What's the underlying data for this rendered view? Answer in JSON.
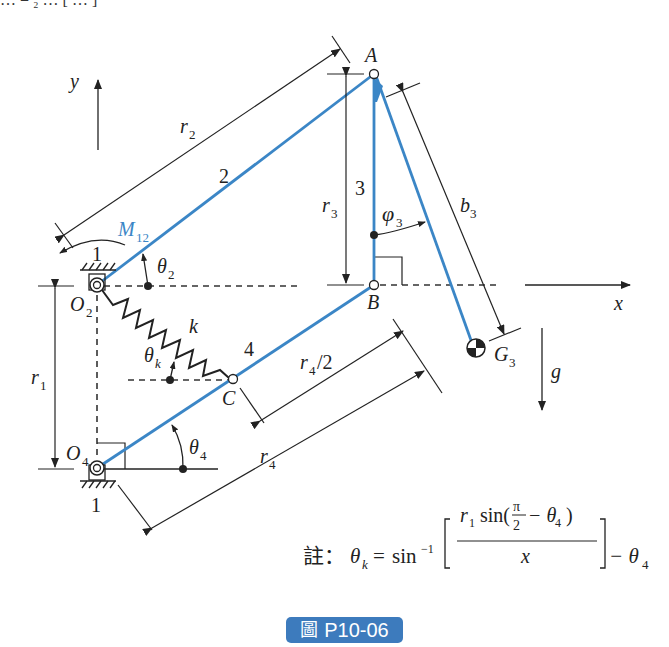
{
  "top_fragment": "… = ₂ … [ … ]",
  "figure": {
    "axes": {
      "x": "x",
      "y": "y",
      "gravity": "g"
    },
    "links": [
      {
        "id": "1",
        "label": "1",
        "role": "ground"
      },
      {
        "id": "2",
        "label": "2"
      },
      {
        "id": "3",
        "label": "3"
      },
      {
        "id": "4",
        "label": "4"
      }
    ],
    "points": {
      "O2": "O",
      "O2_sub": "2",
      "O4": "O",
      "O4_sub": "4",
      "A": "A",
      "B": "B",
      "C": "C",
      "G3": "G",
      "G3_sub": "3"
    },
    "dimensions": {
      "r1": "r",
      "r1_sub": "1",
      "r2": "r",
      "r2_sub": "2",
      "r3": "r",
      "r3_sub": "3",
      "r4": "r",
      "r4_sub": "4",
      "r4half": "r",
      "r4half_sub": "4",
      "r4half_suffix": "/2",
      "b3": "b",
      "b3_sub": "3"
    },
    "angles": {
      "theta2": "θ",
      "theta2_sub": "2",
      "theta4": "θ",
      "theta4_sub": "4",
      "thetak": "θ",
      "thetak_sub": "k",
      "phi3": "φ",
      "phi3_sub": "3"
    },
    "spring": "k",
    "moment": {
      "label": "M",
      "sub": "12"
    },
    "ground_labels": [
      "1",
      "1"
    ],
    "link_color": "#3b86c6"
  },
  "note": {
    "prefix": "註：",
    "lhs": "θ",
    "lhs_sub": "k",
    "eq": "=",
    "func": "sin",
    "func_sup": "−1",
    "numerator_r": "r",
    "numerator_r_sub": "1",
    "numerator_sin": "sin(",
    "pi": "π",
    "two": "2",
    "minus_theta": "− θ",
    "minus_theta_sub": "4",
    "close": ")",
    "denominator": "x",
    "tail": "− θ",
    "tail_sub": "4"
  },
  "caption": {
    "icon": "圖",
    "text": "P10-06",
    "bg": "#3d7bbd"
  }
}
